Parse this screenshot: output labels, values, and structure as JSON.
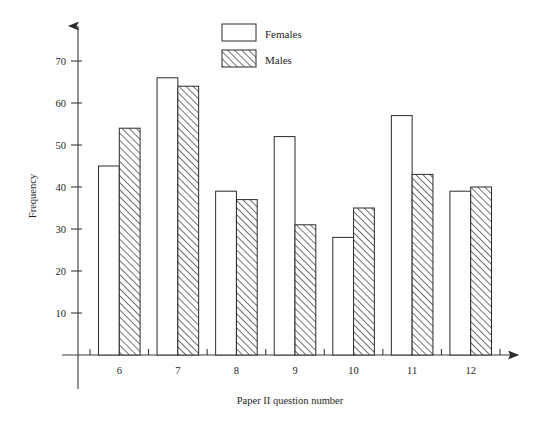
{
  "chart_data": {
    "type": "bar",
    "title": "",
    "xlabel": "Paper II question number",
    "ylabel": "Frequency",
    "categories": [
      "6",
      "7",
      "8",
      "9",
      "10",
      "11",
      "12"
    ],
    "series": [
      {
        "name": "Females",
        "values": [
          45,
          66,
          39,
          52,
          28,
          57,
          39
        ],
        "fill": "white",
        "pattern": "solid"
      },
      {
        "name": "Males",
        "values": [
          54,
          64,
          37,
          31,
          35,
          43,
          40
        ],
        "fill": "white",
        "pattern": "diagonal-hatch"
      }
    ],
    "ylim": [
      0,
      75
    ],
    "yticks": [
      10,
      20,
      30,
      40,
      50,
      60,
      70
    ],
    "ytick_labels": [
      "10",
      "20",
      "30",
      "40",
      "50",
      "60",
      "70"
    ],
    "grid": false,
    "legend_position": "top-center",
    "axis_style": "arrow-headed",
    "colors": {
      "axis": "#3a3a3a",
      "bar_outline": "#2b2b2b",
      "hatch": "#4a4a4a",
      "text": "#1e1e1e",
      "background": "#ffffff"
    }
  },
  "legend": {
    "entries": [
      {
        "label": "Females",
        "swatch": "empty-rect"
      },
      {
        "label": "Males",
        "swatch": "hatched-rect"
      }
    ]
  },
  "axes": {
    "y": {
      "label": "Frequency"
    },
    "x": {
      "label": "Paper II question number"
    }
  }
}
